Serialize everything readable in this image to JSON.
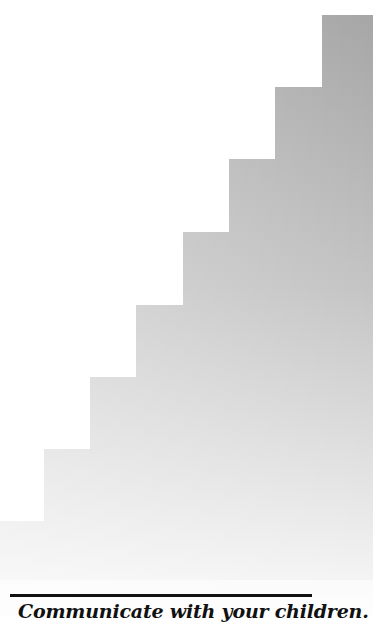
{
  "figure": {
    "type": "staircase-illustration",
    "steps": 8,
    "fill_top_color": "#a8a8a8",
    "fill_bottom_color": "#ffffff"
  },
  "caption": {
    "text": "Communicate with your children."
  }
}
